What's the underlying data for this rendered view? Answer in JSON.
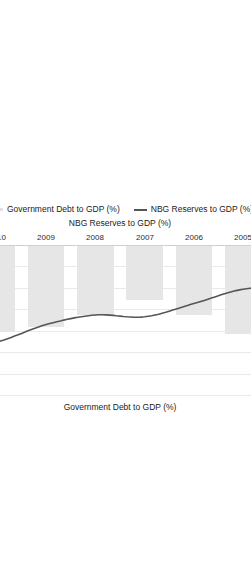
{
  "chart_data": {
    "type": "bar",
    "title": "",
    "orientation": "rotated-180",
    "categories": [
      "2003",
      "2004",
      "2005",
      "2006",
      "2007",
      "2008",
      "2009",
      "2010",
      "2011",
      "2012"
    ],
    "series": [
      {
        "name": "Government Debt to GDP (%)",
        "render": "bar",
        "axis": "secondary",
        "values": [
          63,
          50,
          41,
          32,
          25,
          32,
          38,
          40,
          33,
          34.8
        ],
        "point_labels": {
          "2003": "63",
          "2012": "34.8"
        },
        "color": "#e6e6e6"
      },
      {
        "name": "NBG Reserves to GDP (%)",
        "render": "line",
        "axis": "primary",
        "values": [
          4.9,
          6.8,
          7.2,
          9.6,
          11.8,
          11.5,
          13.1,
          16.0,
          17.4,
          18.1
        ],
        "point_labels": {
          "2003": "4.9",
          "2012": "18.1"
        },
        "color": "#555555"
      }
    ],
    "primary_axis": {
      "label": "NBG Reserves to GDP (%)",
      "ticks": [
        "0",
        "5",
        "10",
        "15",
        "20",
        "25"
      ],
      "lim": [
        0,
        25
      ]
    },
    "secondary_axis": {
      "label": "Government Debt to GDP (%)",
      "ticks": [
        "0",
        "10",
        "20",
        "30",
        "40",
        "50",
        "60",
        "70"
      ],
      "lim": [
        0,
        70
      ]
    },
    "grid": true,
    "legend_position": "bottom",
    "legend": [
      {
        "label": "Government Debt to GDP (%)",
        "marker": "bar-swatch"
      },
      {
        "label": "NBG Reserves to GDP (%)",
        "marker": "line-swatch"
      }
    ]
  },
  "axes": {
    "top_title": "Government Debt to GDP (%)",
    "bottom_title": "NBG Reserves to GDP (%)",
    "top_ticks": [
      "0",
      "10",
      "20",
      "30",
      "40",
      "50",
      "60",
      "70"
    ],
    "bottom_ticks": [
      "0",
      "5",
      "10",
      "15",
      "20",
      "25"
    ],
    "category_ticks": [
      "2003",
      "2004",
      "2005",
      "2006",
      "2007",
      "2008",
      "2009",
      "2010",
      "2011",
      "2012"
    ]
  },
  "labels": {
    "debt_2003": "63",
    "debt_2012": "34.8",
    "res_2003": "4.9",
    "res_2012": "18.1"
  },
  "legend": {
    "debt": "Government Debt to GDP (%)",
    "reserves": "NBG Reserves to GDP (%)"
  },
  "colors": {
    "bar": "#e6e6e6",
    "line": "#555555",
    "grid": "#e9e9e9",
    "text": "#1b1b1b"
  }
}
